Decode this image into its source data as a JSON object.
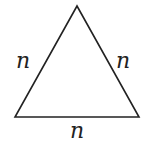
{
  "diagram": {
    "shape": "equilateral-triangle",
    "vertices": [
      [
        77,
        6
      ],
      [
        15,
        117
      ],
      [
        139,
        117
      ]
    ],
    "stroke_color": "#222222",
    "labels": {
      "left_side": "n",
      "right_side": "n",
      "bottom_side": "n"
    }
  }
}
